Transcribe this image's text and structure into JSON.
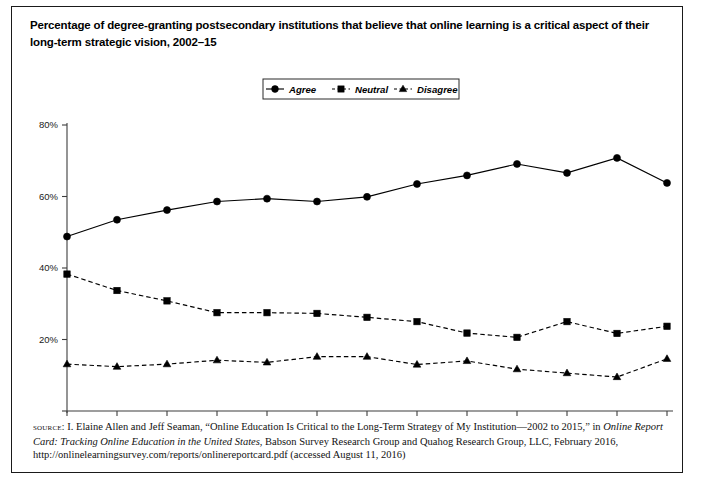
{
  "figure": {
    "title": "Percentage of degree-granting postsecondary institutions that believe that online learning is a critical aspect of their long-term strategic vision, 2002–15",
    "source_label": "source:",
    "source_line1": " I. Elaine Allen and Jeff Seaman, “Online Education Is Critical to the Long-Term Strategy of My Institution—2002 to 2015,” in ",
    "source_italic1": "Online Report Card: Tracking Online Education in the United States",
    "source_line2": ", Babson Survey Research Group and Quahog Research Group, LLC, February 2016, http://onlinelearningsurvey.com/reports/onlinereportcard.pdf (accessed August 11, 2016)"
  },
  "chart_data": {
    "type": "line",
    "title": "Percentage of degree-granting postsecondary institutions that believe that online learning is a critical aspect of their long-term strategic vision, 2002–15",
    "xlabel": "",
    "ylabel": "",
    "categories": [
      "Fall 2002",
      "Fall 2003",
      "Fall 2004",
      "Fall 2005",
      "Fall 2006",
      "Fall 2007",
      "Fall 2009",
      "Fall 2010",
      "Fall 2011",
      "Fall 2012",
      "Fall 2013",
      "Fall 2014",
      "Fall 2015"
    ],
    "ylim": [
      0,
      80
    ],
    "yticks": [
      0,
      20,
      40,
      60,
      80
    ],
    "ytick_labels": [
      "",
      "20%",
      "40%",
      "60%",
      "80%"
    ],
    "grid": false,
    "legend_position": "top-center",
    "series": [
      {
        "name": "Agree",
        "marker": "circle",
        "dash": "solid",
        "values": [
          48.8,
          53.5,
          56.2,
          58.6,
          59.4,
          58.6,
          59.9,
          63.5,
          65.9,
          69.1,
          66.6,
          70.8,
          63.8
        ]
      },
      {
        "name": "Neutral",
        "marker": "square",
        "dash": "dashed",
        "values": [
          38.3,
          33.7,
          30.8,
          27.5,
          27.5,
          27.3,
          26.2,
          25.0,
          21.8,
          20.6,
          25.0,
          21.7,
          23.7
        ]
      },
      {
        "name": "Disagree",
        "marker": "triangle",
        "dash": "dashed",
        "values": [
          13.1,
          12.4,
          13.1,
          14.2,
          13.6,
          15.2,
          15.2,
          13.0,
          14.0,
          11.7,
          10.6,
          9.5,
          14.6
        ]
      }
    ]
  }
}
